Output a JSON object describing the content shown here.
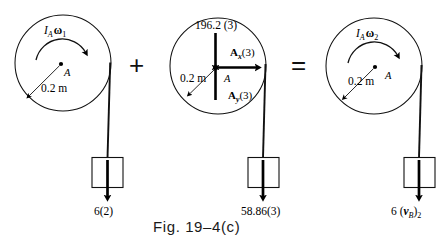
{
  "figure": {
    "caption": "Fig. 19–4(c)",
    "operators": {
      "plus": "+",
      "equals": "="
    }
  },
  "panels": [
    {
      "id": "initial-momentum",
      "role": "initial-angular-momentum",
      "disk": {
        "center_label": "A",
        "radius_label": "0.2 m",
        "momentum_label_I": "I",
        "momentum_label_I_sub": "A",
        "momentum_label_omega": "ω",
        "momentum_label_omega_sub": "1",
        "spin_direction": "clockwise"
      },
      "block": {
        "force_label": "6(2)",
        "arrow_direction": "down"
      }
    },
    {
      "id": "impulses",
      "role": "angular-impulse",
      "disk": {
        "center_label": "A",
        "radius_label": "0.2 m",
        "weight_label": "196.2 (3)",
        "weight_direction": "down",
        "reaction_x_label_main": "A",
        "reaction_x_label_sub": "x",
        "reaction_x_label_tail": "(3)",
        "reaction_x_direction": "right",
        "reaction_y_label_main": "A",
        "reaction_y_label_sub": "y",
        "reaction_y_label_tail": "(3)",
        "reaction_y_direction": "up"
      },
      "block": {
        "force_label": "58.86(3)",
        "arrow_direction": "down"
      }
    },
    {
      "id": "final-momentum",
      "role": "final-angular-momentum",
      "disk": {
        "center_label": "A",
        "radius_label": "0.2 m",
        "momentum_label_I": "I",
        "momentum_label_I_sub": "A",
        "momentum_label_omega": "ω",
        "momentum_label_omega_sub": "2",
        "spin_direction": "clockwise"
      },
      "block": {
        "force_label_lead": "6 (",
        "force_label_v": "v",
        "force_label_v_sub": "B",
        "force_label_close": ")",
        "force_label_state": "2",
        "arrow_direction": "down"
      }
    }
  ],
  "colors": {
    "ink": "#000000",
    "stroke": "#111111"
  }
}
